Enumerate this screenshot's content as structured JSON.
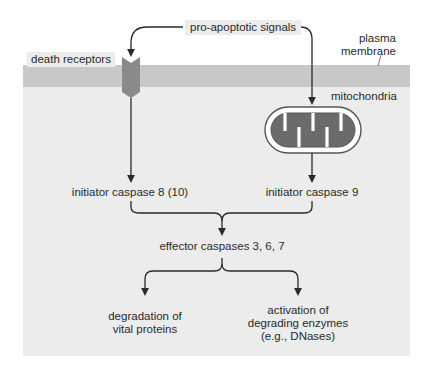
{
  "diagram": {
    "signals_label": "pro-apoptotic signals",
    "death_receptors_label": "death receptors",
    "plasma_membrane_label": [
      "plasma",
      "membrane"
    ],
    "mitochondria_label": "mitochondria",
    "initiator_8_label": "initiator caspase 8 (10)",
    "initiator_9_label": "initiator caspase 9",
    "effector_label": "effector caspases 3, 6, 7",
    "outcome_left": [
      "degradation of",
      "vital proteins"
    ],
    "outcome_right": [
      "activation of",
      "degrading enzymes",
      "(e.g., DNases)"
    ]
  },
  "colors": {
    "panel": "#ececec",
    "membrane": "#c8c8c8",
    "receptor": "#8a8a8a",
    "mito_matrix": "#6b6b6b",
    "line": "#2a2a2a"
  }
}
